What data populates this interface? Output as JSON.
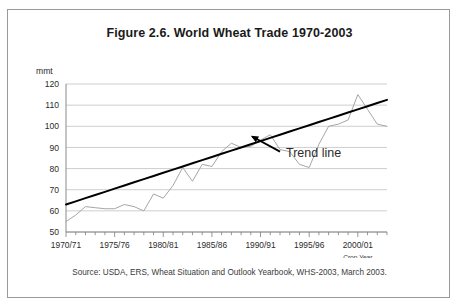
{
  "figure": {
    "title": "Figure 2.6. World Wheat Trade 1970-2003",
    "source": "Source: USDA, ERS, Wheat Situation and Outlook Yearbook, WHS-2003, March 2003."
  },
  "colors": {
    "series_line": "#a6a6a6",
    "trend_line": "#000000",
    "gridline": "#c8c8c8",
    "axis": "#7d7d7d",
    "frame_border": "#9a9a9a",
    "text": "#231f20"
  },
  "chart_data": {
    "type": "line",
    "title": "Figure 2.6. World Wheat Trade 1970-2003",
    "xlabel": "Crop Year",
    "ylabel": "mmt",
    "ylim": [
      50,
      120
    ],
    "ytick_values": [
      50,
      60,
      70,
      80,
      90,
      100,
      110,
      120
    ],
    "ytick_labels": [
      "50",
      "60",
      "70",
      "80",
      "90",
      "100",
      "110",
      "120"
    ],
    "grid": true,
    "legend": "none",
    "xtick_labels": [
      "1970/71",
      "1975/76",
      "1980/81",
      "1985/86",
      "1990/91",
      "1995/96",
      "2000/01"
    ],
    "xtick_label_indices": [
      0,
      5,
      10,
      15,
      20,
      25,
      30
    ],
    "x": [
      "1970/71",
      "1971/72",
      "1972/73",
      "1973/74",
      "1974/75",
      "1975/76",
      "1976/77",
      "1977/78",
      "1978/79",
      "1979/80",
      "1980/81",
      "1981/82",
      "1982/83",
      "1983/84",
      "1984/85",
      "1985/86",
      "1986/87",
      "1987/88",
      "1988/89",
      "1989/90",
      "1990/91",
      "1991/92",
      "1992/93",
      "1993/94",
      "1994/95",
      "1995/96",
      "1996/97",
      "1997/98",
      "1998/99",
      "1999/00",
      "2000/01",
      "2001/02",
      "2002/03",
      "2003/04"
    ],
    "series": [
      {
        "name": "World wheat trade",
        "type": "line",
        "color": "#a6a6a6",
        "values": [
          55,
          58,
          62,
          61.5,
          61,
          61,
          63,
          62,
          60,
          68,
          66,
          72,
          80.5,
          74,
          82,
          81,
          88,
          92,
          90,
          90.5,
          93.5,
          96,
          89,
          88,
          82,
          80.5,
          91.5,
          100,
          101,
          103,
          115,
          108,
          101,
          100
        ]
      },
      {
        "name": "Trend line",
        "type": "line",
        "color": "#000000",
        "values": [
          63,
          64.5,
          66,
          67.5,
          69,
          70.5,
          72,
          73.5,
          75,
          76.5,
          78,
          79.5,
          81,
          82.5,
          84,
          85.5,
          87,
          88.5,
          90,
          91.5,
          93,
          94.5,
          96,
          97.5,
          99,
          100.5,
          102,
          103.5,
          105,
          106.5,
          108,
          109.5,
          111,
          112.5
        ]
      }
    ],
    "annotations": [
      {
        "text": "Trend line",
        "x_index": 22,
        "y_value": 88,
        "arrow_to_x_index": 19,
        "arrow_to_y_value": 95.5
      }
    ]
  }
}
